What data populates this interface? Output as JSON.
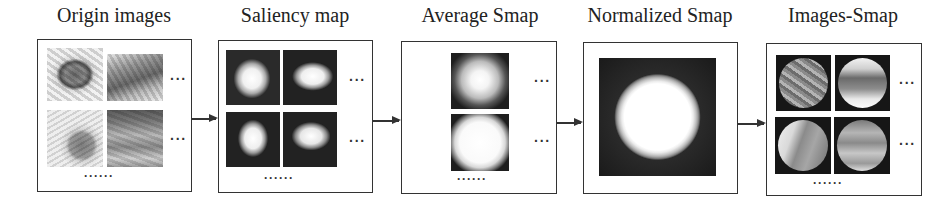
{
  "stages": [
    {
      "id": "origin",
      "title": "Origin images",
      "row_ellipsis": "···",
      "col_ellipsis": "······"
    },
    {
      "id": "saliency",
      "title": "Saliency map",
      "row_ellipsis": "···",
      "col_ellipsis": "······"
    },
    {
      "id": "average",
      "title": "Average Smap",
      "row_ellipsis": "···",
      "col_ellipsis": "······"
    },
    {
      "id": "normalized",
      "title": "Normalized Smap"
    },
    {
      "id": "images_smap",
      "title": "Images-Smap",
      "row_ellipsis": "···",
      "col_ellipsis": "······"
    }
  ],
  "flow": [
    {
      "from": "origin",
      "to": "saliency"
    },
    {
      "from": "saliency",
      "to": "average"
    },
    {
      "from": "average",
      "to": "normalized"
    },
    {
      "from": "normalized",
      "to": "images_smap"
    }
  ],
  "colors": {
    "line": "#333333",
    "background": "#ffffff",
    "map_dark": "#1c1c1c"
  }
}
